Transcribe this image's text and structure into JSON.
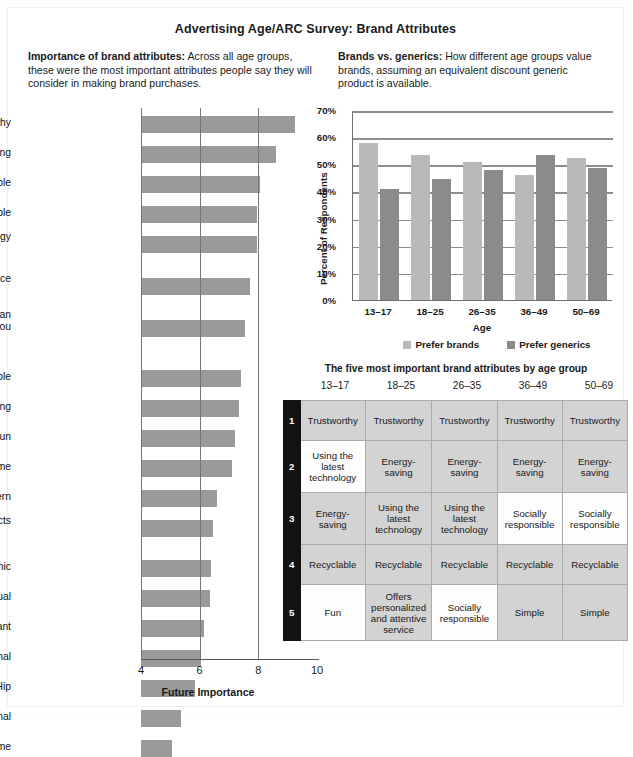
{
  "title": "Advertising Age/ARC Survey: Brand Attributes",
  "blurbs": {
    "left_heading": "Importance of brand attributes:",
    "left_body": " Across all age groups, these were the most important attributes people say they will consider in making brand purchases.",
    "right_heading": "Brands vs. generics:",
    "right_body": " How different age groups value brands, assuming an equivalent discount generic product is available."
  },
  "chart_data": [
    {
      "type": "bar",
      "orientation": "horizontal",
      "title": "Importance of brand attributes",
      "xlabel": "Future Importance",
      "ylabel": "",
      "xlim": [
        4,
        10
      ],
      "xticks": [
        "4",
        "6",
        "8",
        "10"
      ],
      "grid": true,
      "categories": [
        "Trustworthy",
        "Energy-saving",
        "Recyclable",
        "Socially responsible",
        "Using the latest technology",
        "Offers personalized and attentive service",
        "Offers customer service that makes an effort to keep in contact with you",
        "Simple",
        "Small or space-saving",
        "Fun",
        "A well-known brand name",
        "Modern",
        "Personalized or customized products",
        "Organic",
        "Spiritual",
        "Elegant",
        "Traditional",
        "Hip",
        "Multinational",
        "Extreme"
      ],
      "values": [
        9.25,
        8.6,
        8.05,
        7.95,
        7.95,
        7.7,
        7.55,
        7.4,
        7.35,
        7.2,
        7.1,
        6.6,
        6.45,
        6.4,
        6.35,
        6.15,
        6.05,
        5.85,
        5.35,
        5.05
      ]
    },
    {
      "type": "bar",
      "orientation": "vertical",
      "title": "Brands vs. generics",
      "xlabel": "Age",
      "ylabel": "Percent of Respondents",
      "ylim": [
        0,
        70
      ],
      "yticks": [
        "0%",
        "10%",
        "20%",
        "30%",
        "40%",
        "50%",
        "60%",
        "70%"
      ],
      "grid": true,
      "legend_position": "bottom",
      "categories": [
        "13–17",
        "18–25",
        "26–35",
        "36–49",
        "50–69"
      ],
      "series": [
        {
          "name": "Prefer brands",
          "color": "#b9b9b9",
          "values": [
            58,
            53.5,
            51,
            46,
            52.5
          ]
        },
        {
          "name": "Prefer generics",
          "color": "#8b8b8b",
          "values": [
            41,
            44.5,
            48,
            53.5,
            48.5
          ]
        }
      ]
    }
  ],
  "table": {
    "title": "The five most important brand attributes by age group",
    "columns": [
      "13–17",
      "18–25",
      "26–35",
      "36–49",
      "50–69"
    ],
    "rank_labels": [
      "1",
      "2",
      "3",
      "4",
      "5"
    ],
    "rows": [
      {
        "rank": "1",
        "cells": [
          {
            "text": "Trustworthy",
            "shade": "g"
          },
          {
            "text": "Trustworthy",
            "shade": "g"
          },
          {
            "text": "Trustworthy",
            "shade": "g"
          },
          {
            "text": "Trustworthy",
            "shade": "g"
          },
          {
            "text": "Trustworthy",
            "shade": "g"
          }
        ]
      },
      {
        "rank": "2",
        "cells": [
          {
            "text": "Using the latest technology",
            "shade": "w"
          },
          {
            "text": "Energy-saving",
            "shade": "g"
          },
          {
            "text": "Energy-saving",
            "shade": "g"
          },
          {
            "text": "Energy-saving",
            "shade": "g"
          },
          {
            "text": "Energy-saving",
            "shade": "g"
          }
        ]
      },
      {
        "rank": "3",
        "cells": [
          {
            "text": "Energy-saving",
            "shade": "g"
          },
          {
            "text": "Using the latest technology",
            "shade": "g"
          },
          {
            "text": "Using the latest technology",
            "shade": "g"
          },
          {
            "text": "Socially responsible",
            "shade": "w"
          },
          {
            "text": "Socially responsible",
            "shade": "w"
          }
        ]
      },
      {
        "rank": "4",
        "cells": [
          {
            "text": "Recyclable",
            "shade": "g"
          },
          {
            "text": "Recyclable",
            "shade": "g"
          },
          {
            "text": "Recyclable",
            "shade": "g"
          },
          {
            "text": "Recyclable",
            "shade": "g"
          },
          {
            "text": "Recyclable",
            "shade": "g"
          }
        ]
      },
      {
        "rank": "5",
        "cells": [
          {
            "text": "Fun",
            "shade": "w"
          },
          {
            "text": "Offers personalized and attentive service",
            "shade": "g"
          },
          {
            "text": "Socially responsible",
            "shade": "w"
          },
          {
            "text": "Simple",
            "shade": "g"
          },
          {
            "text": "Simple",
            "shade": "g"
          }
        ]
      }
    ]
  },
  "colors": {
    "bar_gray": "#9a9a9a",
    "light_gray": "#b9b9b9",
    "dark_gray": "#8b8b8b",
    "table_shade": "#d3d3d3",
    "rank_column": "#121212"
  }
}
